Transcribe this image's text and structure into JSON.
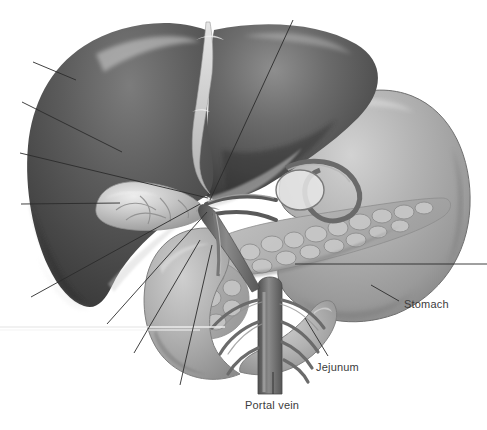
{
  "figure": {
    "style": "grayscale medical airbrush illustration",
    "width": 487,
    "height": 430,
    "background_color": "#ffffff"
  },
  "palette": {
    "background": "#ffffff",
    "liver_dark": "#4a4a4a",
    "liver_mid": "#636363",
    "liver_light": "#8a8a8a",
    "liver_highlight": "#c9c9c9",
    "stomach_mid": "#a9a9a9",
    "stomach_light": "#c4c4c4",
    "stomach_dark": "#7d7d7d",
    "duodenum": "#b3b3b3",
    "pancreas": "#bdbdbd",
    "pancreas_shadow": "#8f8f8f",
    "vessel_dark": "#5e5e5e",
    "vessel_mid": "#7a7a7a",
    "gallbladder": "#cfcfcf",
    "ligament": "#d8d8d8",
    "leader_line": "#2b2b2b",
    "label_text": "#3c3c3c",
    "scanline": "#ececec"
  },
  "structures": [
    {
      "name": "liver",
      "label": "Liver",
      "region": "upper left, large dark organ"
    },
    {
      "name": "gallbladder",
      "label": "Gallbladder",
      "region": "left of hilum, pale ovoid"
    },
    {
      "name": "stomach",
      "label": "Stomach",
      "region": "right, large pale organ"
    },
    {
      "name": "pancreas",
      "label": "Pancreas",
      "region": "centre right, lobulated gland"
    },
    {
      "name": "duodenum",
      "label": "Duodenum",
      "region": "lower centre, C-shaped loop"
    },
    {
      "name": "jejunum",
      "label": "Jejunum",
      "region": "lower right of duodenum"
    },
    {
      "name": "portal-vein",
      "label": "Portal vein",
      "region": "bottom centre vessel trunk"
    },
    {
      "name": "falciform-ligament",
      "label": "Falciform ligament",
      "region": "top centre pale band"
    }
  ],
  "labels": [
    {
      "id": "stomach",
      "text": "Stomach",
      "x": 404,
      "y": 305,
      "anchor": "start"
    },
    {
      "id": "jejunum",
      "text": "Jejunum",
      "x": 316,
      "y": 368,
      "anchor": "start"
    },
    {
      "id": "portal-vein",
      "text": "Portal vein",
      "x": 245,
      "y": 406,
      "anchor": "start"
    }
  ],
  "leader_lines": [
    {
      "id": "leader-1",
      "labelled": false,
      "x1": 33,
      "y1": 62,
      "x2": 76,
      "y2": 80
    },
    {
      "id": "leader-2",
      "labelled": false,
      "x1": 22,
      "y1": 102,
      "x2": 122,
      "y2": 152
    },
    {
      "id": "leader-3",
      "labelled": false,
      "x1": 20,
      "y1": 153,
      "x2": 208,
      "y2": 198
    },
    {
      "id": "leader-4",
      "labelled": false,
      "x1": 21,
      "y1": 204,
      "x2": 120,
      "y2": 203
    },
    {
      "id": "leader-5",
      "labelled": false,
      "x1": 31,
      "y1": 297,
      "x2": 200,
      "y2": 204
    },
    {
      "id": "leader-6",
      "labelled": false,
      "x1": 293,
      "y1": 20,
      "x2": 210,
      "y2": 200
    },
    {
      "id": "leader-7",
      "labelled": false,
      "x1": 107,
      "y1": 324,
      "x2": 207,
      "y2": 212
    },
    {
      "id": "leader-8",
      "labelled": false,
      "x1": 134,
      "y1": 353,
      "x2": 200,
      "y2": 240
    },
    {
      "id": "leader-9",
      "labelled": false,
      "x1": 180,
      "y1": 385,
      "x2": 212,
      "y2": 245
    },
    {
      "id": "leader-10",
      "labelled": false,
      "x1": 487,
      "y1": 264,
      "x2": 295,
      "y2": 264
    },
    {
      "id": "leader-stomach",
      "labelled": true,
      "label": "Stomach",
      "x1": 399,
      "y1": 301,
      "x2": 371,
      "y2": 285
    },
    {
      "id": "leader-jejunum",
      "labelled": true,
      "label": "Jejunum",
      "x1": 328,
      "y1": 356,
      "x2": 305,
      "y2": 318
    },
    {
      "id": "leader-portal-vein",
      "labelled": true,
      "label": "Portal vein",
      "x1": 273,
      "y1": 394,
      "x2": 273,
      "y2": 372
    }
  ],
  "artifacts": [
    {
      "id": "scanline",
      "type": "horizontal-line",
      "y": 327,
      "x1": 0,
      "x2": 225,
      "color": "#ececec"
    }
  ]
}
